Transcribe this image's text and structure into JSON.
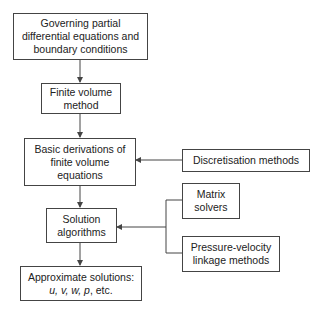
{
  "diagram": {
    "main_flow": [
      {
        "id": "governing",
        "label": "Governing partial\ndifferential equations and\nboundary conditions"
      },
      {
        "id": "fvm",
        "label": "Finite volume\nmethod"
      },
      {
        "id": "derivations",
        "label": "Basic derivations of\nfinite volume\nequations"
      },
      {
        "id": "algorithms",
        "label": "Solution\nalgorithms"
      },
      {
        "id": "solutions",
        "label_line1": "Approximate solutions:",
        "label_vars": "u, v, w, p",
        "label_suffix": ", etc."
      }
    ],
    "side_inputs": [
      {
        "id": "discretisation",
        "label": "Discretisation methods",
        "target": "derivations"
      },
      {
        "id": "matrix",
        "label": "Matrix\nsolvers",
        "target": "algorithms"
      },
      {
        "id": "pressure",
        "label": "Pressure-velocity\nlinkage methods",
        "target": "algorithms"
      }
    ],
    "colors": {
      "line": "#444444",
      "background": "#ffffff",
      "text": "#222222"
    }
  }
}
